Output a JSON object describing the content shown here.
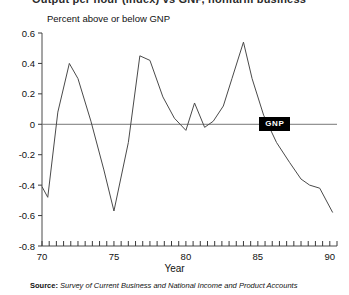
{
  "figure": {
    "clipped_title": "Output per hour (index) vs GNP, nonfarm business",
    "axis_note": "Percent above or below GNP",
    "xaxis_title": "Year",
    "series_badge": "GNP",
    "source_prefix": "Source:",
    "source_text": "Survey of Current Business and National Income and Product Accounts"
  },
  "chart_data": {
    "type": "line",
    "title": "Percent above or below GNP",
    "xlabel": "Year",
    "ylabel": "Percent above or below GNP",
    "xlim": [
      70,
      90.5
    ],
    "ylim": [
      -0.8,
      0.6
    ],
    "yticks": [
      0.6,
      0.4,
      0.2,
      0,
      -0.2,
      -0.4,
      -0.6,
      -0.8
    ],
    "ytick_labels": [
      "0.6",
      "0.4",
      "0.2",
      "0",
      "-0.2",
      "-0.4",
      "-0.6",
      "-0.8"
    ],
    "xticks": [
      70,
      75,
      80,
      85,
      90
    ],
    "xtick_labels": [
      "70",
      "75",
      "80",
      "85",
      "90"
    ],
    "xminor_step": 0.5,
    "grid": false,
    "legend": "inline-badge",
    "series": [
      {
        "name": "GNP",
        "color": "#4a4a4a",
        "x": [
          70.0,
          70.4,
          71.1,
          71.9,
          72.5,
          73.4,
          74.3,
          75.0,
          76.0,
          76.8,
          77.5,
          78.4,
          79.2,
          80.0,
          80.6,
          81.3,
          81.9,
          82.6,
          83.2,
          84.0,
          84.6,
          85.4,
          86.3,
          87.2,
          88.0,
          88.6,
          89.3,
          90.2
        ],
        "y": [
          -0.41,
          -0.48,
          0.08,
          0.4,
          0.3,
          0.02,
          -0.3,
          -0.57,
          -0.12,
          0.45,
          0.42,
          0.18,
          0.04,
          -0.04,
          0.14,
          -0.02,
          0.02,
          0.12,
          0.3,
          0.54,
          0.3,
          0.06,
          -0.12,
          -0.25,
          -0.36,
          -0.4,
          -0.42,
          -0.58
        ]
      }
    ]
  }
}
